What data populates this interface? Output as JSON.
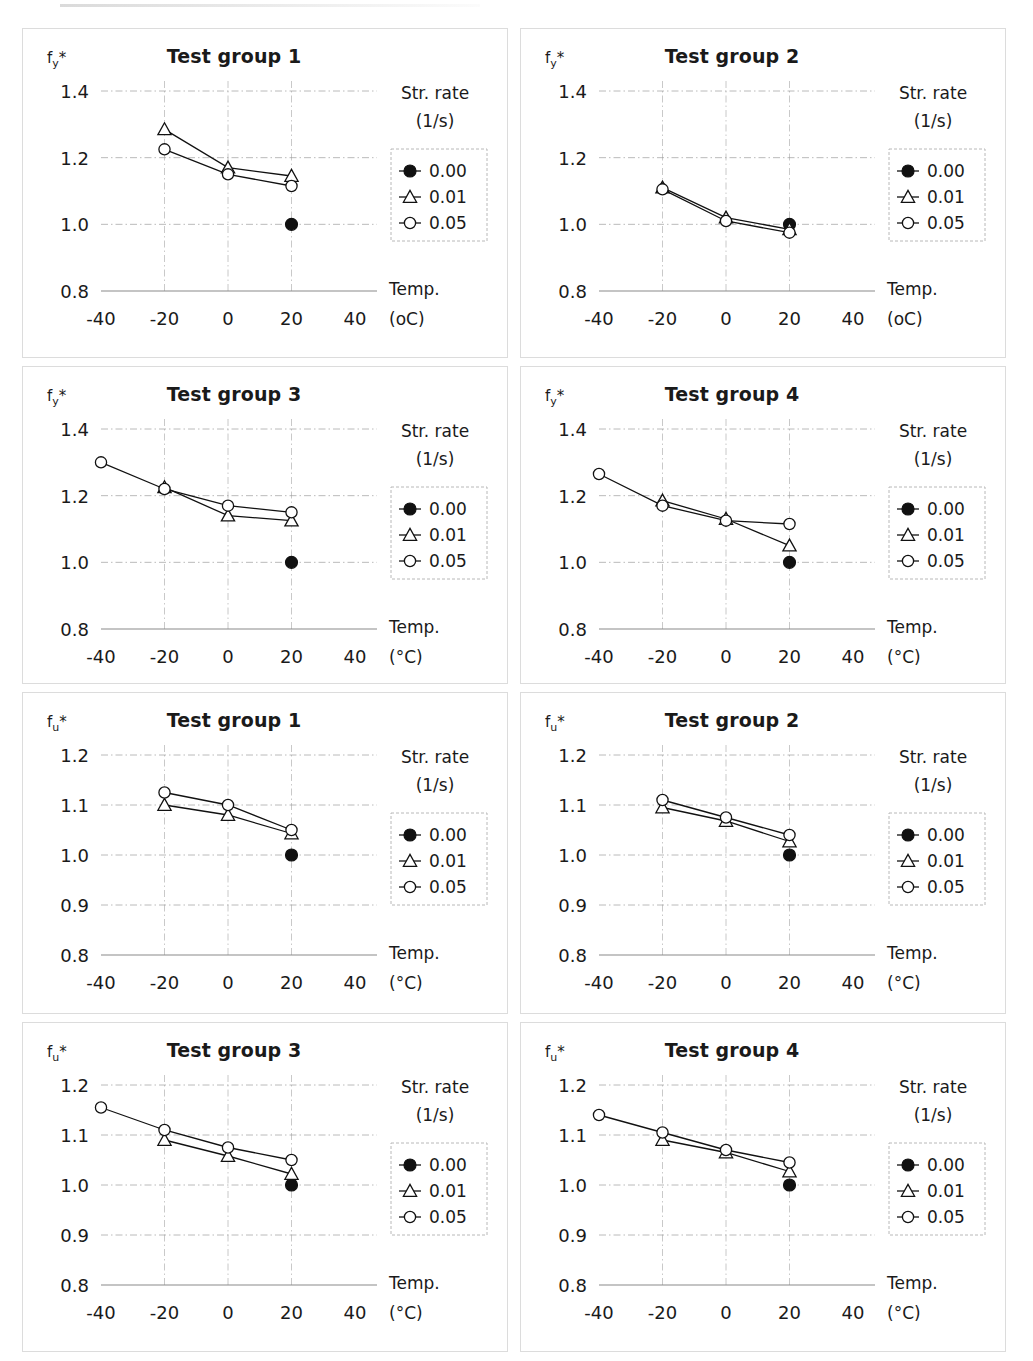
{
  "figure": {
    "panel_count": 8,
    "legend": {
      "header_line1": "Str. rate",
      "header_line2": "(1/s)",
      "entries": [
        {
          "label": "0.00",
          "marker": "filled-circle"
        },
        {
          "label": "0.01",
          "marker": "open-triangle"
        },
        {
          "label": "0.05",
          "marker": "open-circle"
        }
      ]
    },
    "axis": {
      "x_title_line1": "Temp.",
      "x_unit_plain": "(oC)",
      "x_unit_degree": "(°C)",
      "x_ticks": [
        "-40",
        "-20",
        "0",
        "20",
        "40"
      ],
      "y_ticks_fy": [
        "0.8",
        "1.0",
        "1.2",
        "1.4"
      ],
      "y_ticks_fu": [
        "0.8",
        "0.9",
        "1.0",
        "1.1",
        "1.2"
      ]
    }
  },
  "chart_data": [
    {
      "type": "line",
      "title": "Test group 1",
      "ylabel": "f",
      "ylabel_sub": "y",
      "ylabel_star": "*",
      "xlabel": "Temp.",
      "xunit": "(oC)",
      "xlim": [
        -40,
        40
      ],
      "ylim": [
        0.8,
        1.4
      ],
      "yticks": [
        0.8,
        1.0,
        1.2,
        1.4
      ],
      "xticks": [
        -40,
        -20,
        0,
        20,
        40
      ],
      "grid": true,
      "legend_position": "right",
      "series": [
        {
          "name": "0.00",
          "marker": "filled-circle",
          "x": [
            20
          ],
          "values": [
            1.0
          ]
        },
        {
          "name": "0.01",
          "marker": "open-triangle",
          "x": [
            -20,
            0,
            20
          ],
          "values": [
            1.285,
            1.17,
            1.145
          ]
        },
        {
          "name": "0.05",
          "marker": "open-circle",
          "x": [
            -20,
            0,
            20
          ],
          "values": [
            1.225,
            1.15,
            1.115
          ]
        }
      ]
    },
    {
      "type": "line",
      "title": "Test group 2",
      "ylabel": "f",
      "ylabel_sub": "y",
      "ylabel_star": "*",
      "xlabel": "Temp.",
      "xunit": "(oC)",
      "xlim": [
        -40,
        40
      ],
      "ylim": [
        0.8,
        1.4
      ],
      "yticks": [
        0.8,
        1.0,
        1.2,
        1.4
      ],
      "xticks": [
        -40,
        -20,
        0,
        20,
        40
      ],
      "grid": true,
      "legend_position": "right",
      "series": [
        {
          "name": "0.00",
          "marker": "filled-circle",
          "x": [
            20
          ],
          "values": [
            1.0
          ]
        },
        {
          "name": "0.01",
          "marker": "open-triangle",
          "x": [
            -20,
            0,
            20
          ],
          "values": [
            1.11,
            1.02,
            0.985
          ]
        },
        {
          "name": "0.05",
          "marker": "open-circle",
          "x": [
            -20,
            0,
            20
          ],
          "values": [
            1.105,
            1.01,
            0.975
          ]
        }
      ]
    },
    {
      "type": "line",
      "title": "Test group 3",
      "ylabel": "f",
      "ylabel_sub": "y",
      "ylabel_star": "*",
      "xlabel": "Temp.",
      "xunit": "(°C)",
      "xlim": [
        -40,
        40
      ],
      "ylim": [
        0.8,
        1.4
      ],
      "yticks": [
        0.8,
        1.0,
        1.2,
        1.4
      ],
      "xticks": [
        -40,
        -20,
        0,
        20,
        40
      ],
      "grid": true,
      "legend_position": "right",
      "series": [
        {
          "name": "0.00",
          "marker": "filled-circle",
          "x": [
            20
          ],
          "values": [
            1.0
          ]
        },
        {
          "name": "0.01",
          "marker": "open-triangle",
          "x": [
            -20,
            0,
            20
          ],
          "values": [
            1.225,
            1.14,
            1.125
          ]
        },
        {
          "name": "0.05",
          "marker": "open-circle",
          "x": [
            -40,
            -20,
            0,
            20
          ],
          "values": [
            1.3,
            1.22,
            1.17,
            1.15
          ]
        }
      ]
    },
    {
      "type": "line",
      "title": "Test group 4",
      "ylabel": "f",
      "ylabel_sub": "y",
      "ylabel_star": "*",
      "xlabel": "Temp.",
      "xunit": "(°C)",
      "xlim": [
        -40,
        40
      ],
      "ylim": [
        0.8,
        1.4
      ],
      "yticks": [
        0.8,
        1.0,
        1.2,
        1.4
      ],
      "xticks": [
        -40,
        -20,
        0,
        20,
        40
      ],
      "grid": true,
      "legend_position": "right",
      "series": [
        {
          "name": "0.00",
          "marker": "filled-circle",
          "x": [
            20
          ],
          "values": [
            1.0
          ]
        },
        {
          "name": "0.01",
          "marker": "open-triangle",
          "x": [
            -20,
            0,
            20
          ],
          "values": [
            1.185,
            1.13,
            1.05
          ]
        },
        {
          "name": "0.05",
          "marker": "open-circle",
          "x": [
            -40,
            -20,
            0,
            20
          ],
          "values": [
            1.265,
            1.17,
            1.125,
            1.115
          ]
        }
      ]
    },
    {
      "type": "line",
      "title": "Test group 1",
      "ylabel": "f",
      "ylabel_sub": "u",
      "ylabel_star": "*",
      "xlabel": "Temp.",
      "xunit": "(°C)",
      "xlim": [
        -40,
        40
      ],
      "ylim": [
        0.8,
        1.2
      ],
      "yticks": [
        0.8,
        0.9,
        1.0,
        1.1,
        1.2
      ],
      "xticks": [
        -40,
        -20,
        0,
        20,
        40
      ],
      "grid": true,
      "legend_position": "right",
      "series": [
        {
          "name": "0.00",
          "marker": "filled-circle",
          "x": [
            20
          ],
          "values": [
            1.0
          ]
        },
        {
          "name": "0.01",
          "marker": "open-triangle",
          "x": [
            -20,
            0,
            20
          ],
          "values": [
            1.1,
            1.08,
            1.043
          ]
        },
        {
          "name": "0.05",
          "marker": "open-circle",
          "x": [
            -20,
            0,
            20
          ],
          "values": [
            1.125,
            1.1,
            1.05
          ]
        }
      ]
    },
    {
      "type": "line",
      "title": "Test group 2",
      "ylabel": "f",
      "ylabel_sub": "u",
      "ylabel_star": "*",
      "xlabel": "Temp.",
      "xunit": "(°C)",
      "xlim": [
        -40,
        40
      ],
      "ylim": [
        0.8,
        1.2
      ],
      "yticks": [
        0.8,
        0.9,
        1.0,
        1.1,
        1.2
      ],
      "xticks": [
        -40,
        -20,
        0,
        20,
        40
      ],
      "grid": true,
      "legend_position": "right",
      "series": [
        {
          "name": "0.00",
          "marker": "filled-circle",
          "x": [
            20
          ],
          "values": [
            1.0
          ]
        },
        {
          "name": "0.01",
          "marker": "open-triangle",
          "x": [
            -20,
            0,
            20
          ],
          "values": [
            1.095,
            1.068,
            1.027
          ]
        },
        {
          "name": "0.05",
          "marker": "open-circle",
          "x": [
            -20,
            0,
            20
          ],
          "values": [
            1.11,
            1.075,
            1.04
          ]
        }
      ]
    },
    {
      "type": "line",
      "title": "Test group 3",
      "ylabel": "f",
      "ylabel_sub": "u",
      "ylabel_star": "*",
      "xlabel": "Temp.",
      "xunit": "(°C)",
      "xlim": [
        -40,
        40
      ],
      "ylim": [
        0.8,
        1.2
      ],
      "yticks": [
        0.8,
        0.9,
        1.0,
        1.1,
        1.2
      ],
      "xticks": [
        -40,
        -20,
        0,
        20,
        40
      ],
      "grid": true,
      "legend_position": "right",
      "series": [
        {
          "name": "0.00",
          "marker": "filled-circle",
          "x": [
            20
          ],
          "values": [
            1.0
          ]
        },
        {
          "name": "0.01",
          "marker": "open-triangle",
          "x": [
            -20,
            0,
            20
          ],
          "values": [
            1.09,
            1.058,
            1.022
          ]
        },
        {
          "name": "0.05",
          "marker": "open-circle",
          "x": [
            -40,
            -20,
            0,
            20
          ],
          "values": [
            1.155,
            1.11,
            1.075,
            1.05
          ]
        }
      ]
    },
    {
      "type": "line",
      "title": "Test group 4",
      "ylabel": "f",
      "ylabel_sub": "u",
      "ylabel_star": "*",
      "xlabel": "Temp.",
      "xunit": "(°C)",
      "xlim": [
        -40,
        40
      ],
      "ylim": [
        0.8,
        1.2
      ],
      "yticks": [
        0.8,
        0.9,
        1.0,
        1.1,
        1.2
      ],
      "xticks": [
        -40,
        -20,
        0,
        20,
        40
      ],
      "grid": true,
      "legend_position": "right",
      "series": [
        {
          "name": "0.00",
          "marker": "filled-circle",
          "x": [
            20
          ],
          "values": [
            1.0
          ]
        },
        {
          "name": "0.01",
          "marker": "open-triangle",
          "x": [
            -20,
            0,
            20
          ],
          "values": [
            1.09,
            1.065,
            1.027
          ]
        },
        {
          "name": "0.05",
          "marker": "open-circle",
          "x": [
            -40,
            -20,
            0,
            20
          ],
          "values": [
            1.14,
            1.105,
            1.07,
            1.045
          ]
        }
      ]
    }
  ]
}
